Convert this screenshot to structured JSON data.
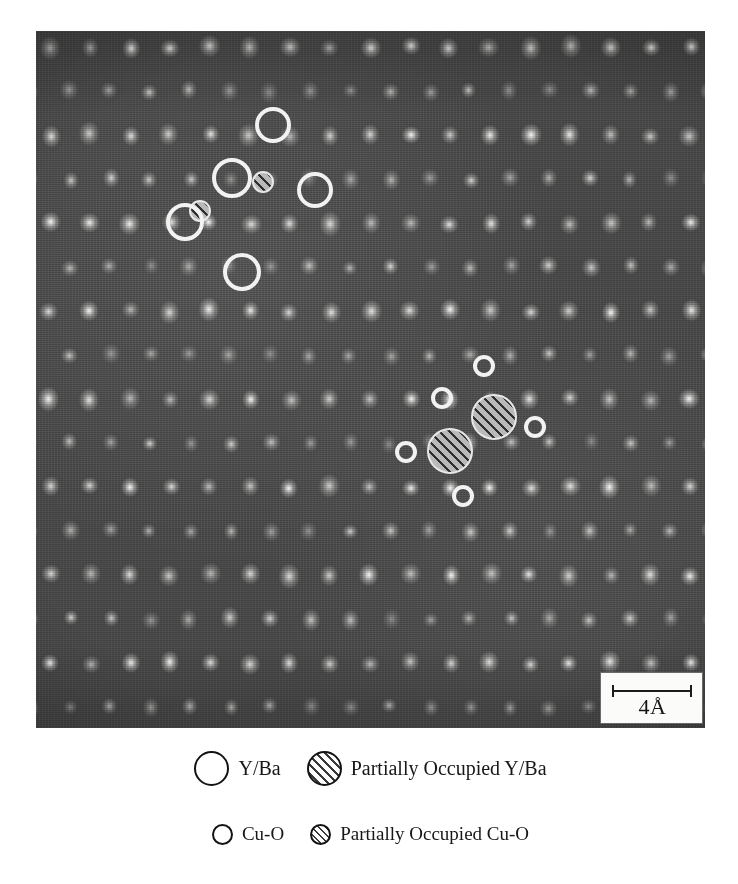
{
  "figure": {
    "type": "hrtem-micrograph",
    "scalebar": {
      "label": "4Å",
      "value": 4,
      "unit": "Å",
      "bar_length_px": 80
    },
    "micrograph": {
      "frame": {
        "x": 36,
        "y": 31,
        "width": 669,
        "height": 697
      },
      "background_color": "#4a4a4a",
      "spot_color": "#e8e8e8",
      "lattice": {
        "spacing_x": 40,
        "spacing_y": 44,
        "stagger": "checkerboard",
        "origin_x": 14,
        "origin_y": 16
      }
    },
    "marker_styles": {
      "ring_color": "#f2f2f2",
      "hatch_fill": "#b9b9b9",
      "hatch_line": "#2e2e2e"
    },
    "annotations": {
      "upper_cluster": {
        "name": "Y/Ba site cluster",
        "markers": [
          {
            "kind": "ring",
            "size": "large",
            "cx": 273,
            "cy": 125,
            "r": 18
          },
          {
            "kind": "ring",
            "size": "large",
            "cx": 232,
            "cy": 178,
            "r": 20
          },
          {
            "kind": "hatch",
            "size": "small",
            "cx": 263,
            "cy": 182,
            "r": 11
          },
          {
            "kind": "ring",
            "size": "large",
            "cx": 315,
            "cy": 190,
            "r": 18
          },
          {
            "kind": "hatch",
            "size": "small",
            "cx": 200,
            "cy": 211,
            "r": 11
          },
          {
            "kind": "ring",
            "size": "large",
            "cx": 185,
            "cy": 222,
            "r": 19
          },
          {
            "kind": "ring",
            "size": "large",
            "cx": 242,
            "cy": 272,
            "r": 19
          }
        ]
      },
      "lower_cluster": {
        "name": "Cu-O site cluster",
        "markers": [
          {
            "kind": "ring",
            "size": "small",
            "cx": 484,
            "cy": 366,
            "r": 11
          },
          {
            "kind": "ring",
            "size": "small",
            "cx": 442,
            "cy": 398,
            "r": 11
          },
          {
            "kind": "hatch",
            "size": "large",
            "cx": 494,
            "cy": 417,
            "r": 23
          },
          {
            "kind": "ring",
            "size": "small",
            "cx": 535,
            "cy": 427,
            "r": 11
          },
          {
            "kind": "hatch",
            "size": "large",
            "cx": 450,
            "cy": 451,
            "r": 23
          },
          {
            "kind": "ring",
            "size": "small",
            "cx": 406,
            "cy": 452,
            "r": 11
          },
          {
            "kind": "ring",
            "size": "small",
            "cx": 463,
            "cy": 496,
            "r": 11
          }
        ]
      }
    }
  },
  "legend": {
    "rows": [
      {
        "items": [
          {
            "swatch": "open-large",
            "label": "Y/Ba"
          },
          {
            "swatch": "hatch-large",
            "label": "Partially Occupied Y/Ba"
          }
        ]
      },
      {
        "items": [
          {
            "swatch": "open-small",
            "label": "Cu-O"
          },
          {
            "swatch": "hatch-small",
            "label": "Partially Occupied Cu-O"
          }
        ]
      }
    ]
  }
}
